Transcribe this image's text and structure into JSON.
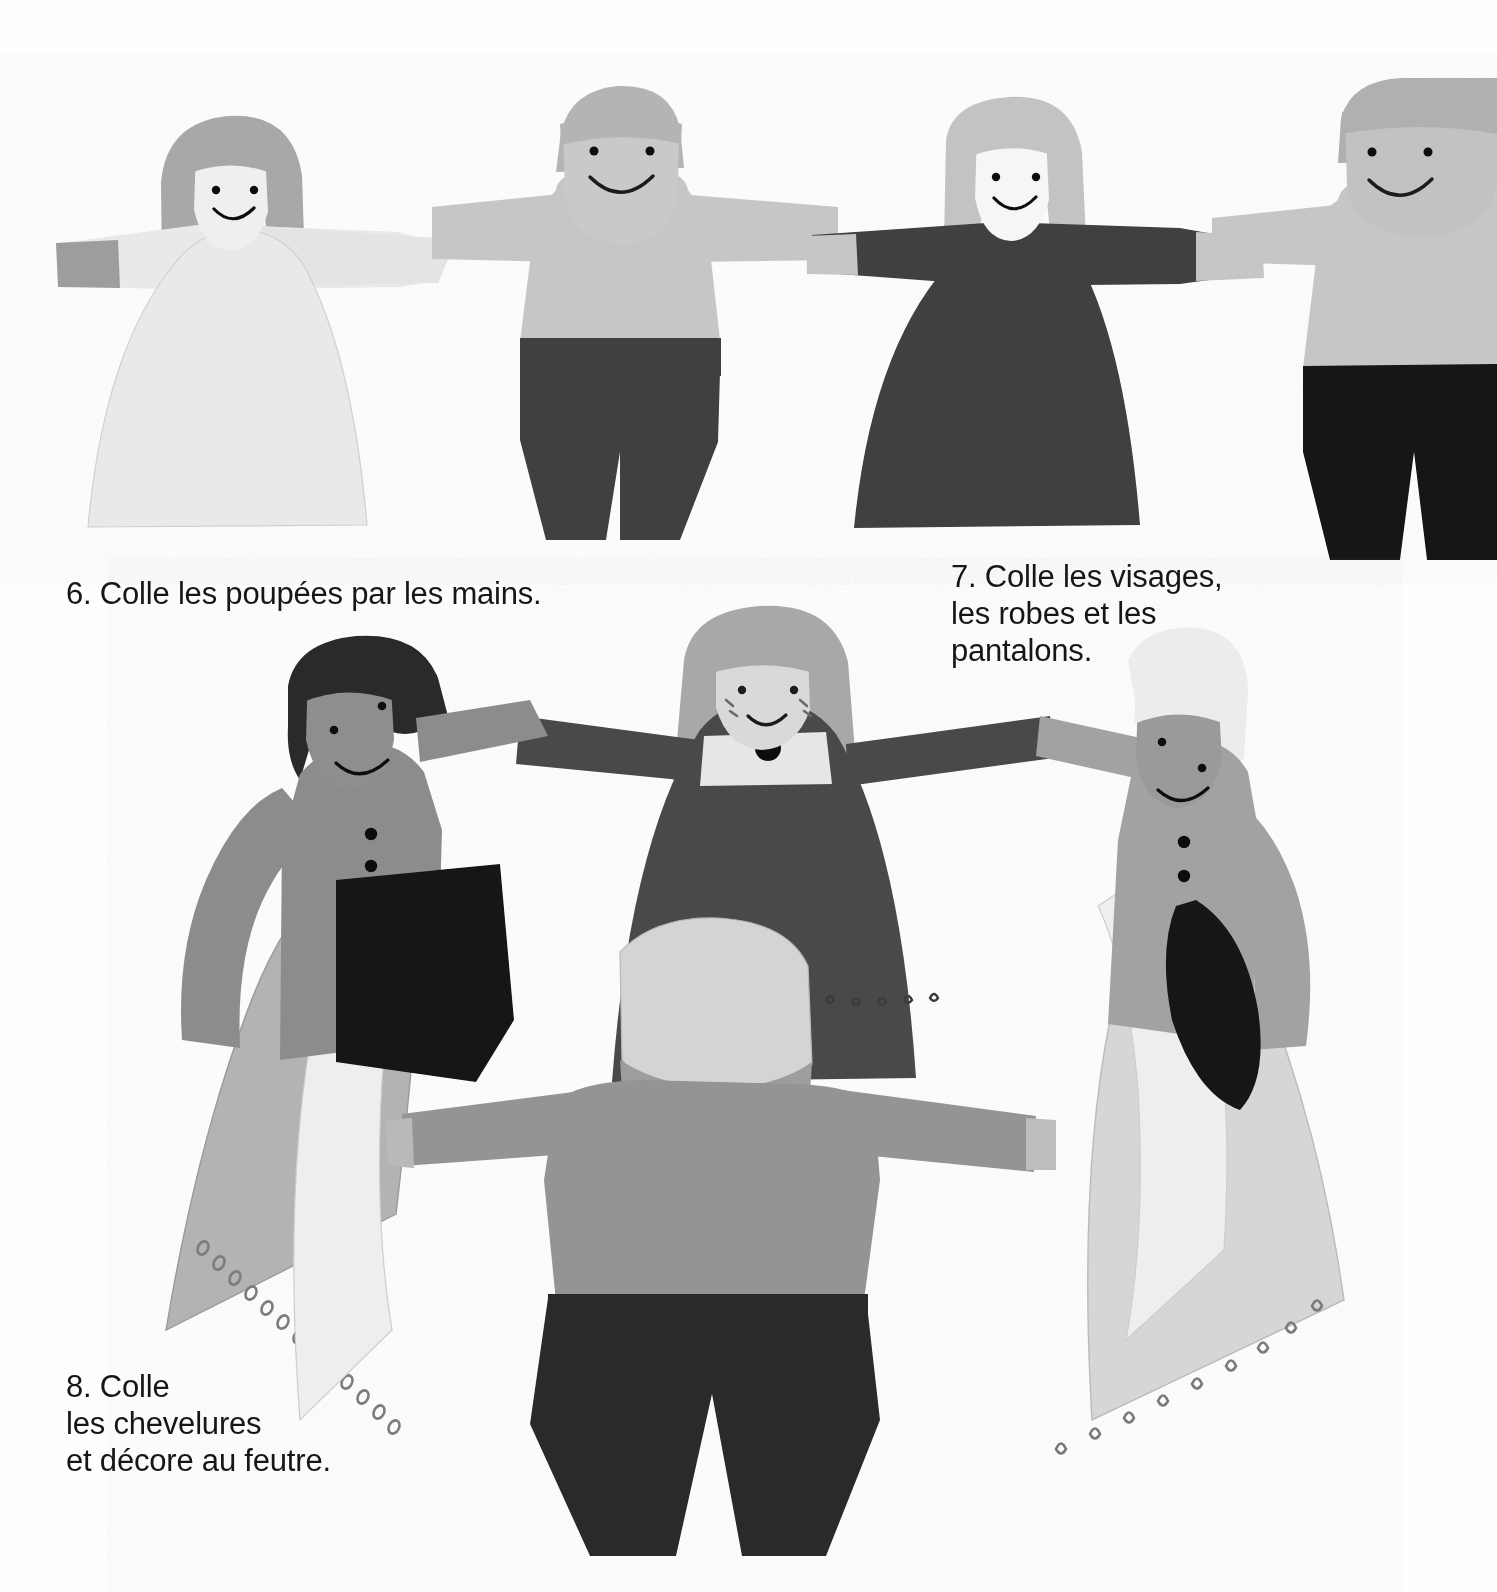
{
  "page": {
    "background": "#fefefe",
    "width": 1497,
    "height": 1592,
    "language": "fr"
  },
  "captions": {
    "step6": {
      "number": "6.",
      "text": "6. Colle les poupées par les mains.",
      "lines": [
        "6. Colle les poupées par les mains."
      ]
    },
    "step7": {
      "number": "7.",
      "text": "7. Colle les visages, les robes et les pantalons.",
      "lines": [
        "7. Colle les visages,",
        "les robes et les",
        "pantalons."
      ]
    },
    "step8": {
      "number": "8.",
      "text": "8. Colle les chevelures et décore au feutre.",
      "lines": [
        "8. Colle",
        "les chevelures",
        "et décore au feutre."
      ]
    }
  },
  "palette": {
    "paper_white": "#fefefe",
    "dress_very_light": "#e9e9e7",
    "face_light": "#e3e3e1",
    "face_white": "#f6f6f4",
    "hair_light_blonde": "#ececea",
    "hair_medium_grey": "#a8a8a6",
    "hair_dark": "#8f8f8d",
    "hair_black": "#2a2a2a",
    "shirt_light_grey": "#c6c6c4",
    "shirt_medium_grey": "#8c8c8a",
    "skin_medium_grey": "#949492",
    "dress_dark_grey": "#4a4a4a",
    "dress_charcoal": "#3c3c3c",
    "pants_dark_grey": "#3f3f3f",
    "pants_black": "#121212",
    "ink_black": "#111111",
    "outline": "#9a9a98",
    "shadow": "#d8d8d6",
    "text": "#161616"
  },
  "top_row": {
    "label": "Rangée du haut : quatre poupées se tenant par les mains",
    "figures": [
      {
        "id": "top-figure-1",
        "type": "girl",
        "garment": "robe",
        "dress_color": "#e9e9e7",
        "hair_color": "#a8a8a6",
        "hair_style": "carré (bob)",
        "face_color": "#efefed",
        "expression": "sourire",
        "eyes": 2
      },
      {
        "id": "top-figure-2",
        "type": "boy",
        "garment": "pantalon",
        "shirt_color": "#c6c6c4",
        "pants_color": "#3f3f3f",
        "hair_color": "#b4b4b2",
        "hair_style": "courts",
        "face_color": "#c9c9c7",
        "expression": "sourire",
        "eyes": 2
      },
      {
        "id": "top-figure-3",
        "type": "girl",
        "garment": "robe",
        "dress_color": "#3f3f3f",
        "hair_color": "#c3c3c1",
        "hair_style": "carré (bob)",
        "face_color": "#f6f6f4",
        "expression": "sourire",
        "eyes": 2
      },
      {
        "id": "top-figure-4",
        "type": "boy",
        "garment": "pantalon",
        "shirt_color": "#c6c6c4",
        "pants_color": "#121212",
        "hair_color": "#b0b0ae",
        "hair_style": "courts",
        "face_color": "#c2c2c0",
        "expression": "sourire",
        "eyes": 2,
        "note": "coupé par le bord droit de l'image"
      }
    ]
  },
  "ring": {
    "label": "Ronde : quatre poupées collées en cercle, décorées au feutre",
    "figures": [
      {
        "id": "ring-figure-left",
        "position": "gauche",
        "type": "boy",
        "hair_color": "#2a2a2a",
        "hair_style": "courts noirs",
        "face_color": "#8e8e8c",
        "shirt_color": "#8c8c8a",
        "pants_color": "#141414",
        "buttons": 3,
        "button_color": "#111111"
      },
      {
        "id": "ring-figure-back",
        "position": "arrière (centre)",
        "type": "girl",
        "hair_color": "#a8a8a6",
        "hair_style": "carré (bob)",
        "face_color": "#d9d9d7",
        "dress_color": "#4a4a4a",
        "collar_color": "#e6e6e4",
        "collar_button_color": "#111111",
        "freckles": 4,
        "hem_decor": "petits motifs au feutre"
      },
      {
        "id": "ring-figure-right",
        "position": "droite",
        "type": "boy",
        "hair_color": "#ececea",
        "hair_style": "courts clairs",
        "face_color": "#9a9a98",
        "shirt_color": "#a2a2a0",
        "pants_color": "#121212",
        "buttons": 2,
        "button_color": "#111111"
      },
      {
        "id": "ring-figure-front",
        "position": "avant (de dos)",
        "type": "boy",
        "hair_color": "#d4d4d2",
        "hair_style": "vu de dos",
        "shirt_color": "#949492",
        "pants_color": "#2b2b2b"
      },
      {
        "id": "ring-dress-left",
        "position": "robe gauche",
        "dress_color": "#b3b3b1",
        "hem_decor": "petits ronds au feutre",
        "hem_decor_count": 13
      },
      {
        "id": "ring-dress-right",
        "position": "robe droite",
        "dress_color": "#d6d6d4",
        "hem_decor": "petits motifs au feutre",
        "hem_decor_count": 9
      }
    ]
  }
}
